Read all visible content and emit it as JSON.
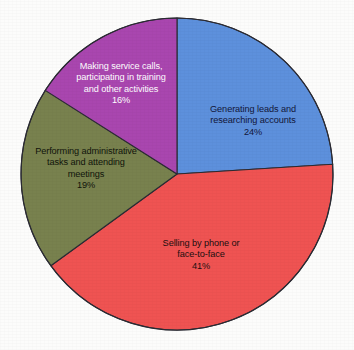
{
  "chart_data": {
    "type": "pie",
    "title": "",
    "subtitle": "",
    "xlabel": "",
    "ylabel": "",
    "legend_position": "none",
    "grid": false,
    "units": "percent",
    "total": 100,
    "start_angle_deg": 0,
    "direction": "clockwise",
    "categories": [
      "Generating leads and researching accounts",
      "Selling by phone or face-to-face",
      "Performing administrative tasks and attending meetings",
      "Making service calls, participating in training and other activities"
    ],
    "values": [
      24,
      41,
      19,
      16
    ],
    "slices": [
      {
        "label": "Generating leads and\nresearching accounts",
        "value": 24,
        "value_text": "24%",
        "color": "#5d90dc",
        "text_color": "#12163a",
        "start_deg": 0,
        "end_deg": 86.4
      },
      {
        "label": "Selling by phone or\nface-to-face",
        "value": 41,
        "value_text": "41%",
        "color": "#ef5352",
        "text_color": "#1b0f0f",
        "start_deg": 86.4,
        "end_deg": 234.0
      },
      {
        "label": "Performing administrative\ntasks and attending\nmeetings",
        "value": 19,
        "value_text": "19%",
        "color": "#78814e",
        "text_color": "#11140b",
        "start_deg": 234.0,
        "end_deg": 302.4
      },
      {
        "label": "Making service calls,\nparticipating in training\nand other activities",
        "value": 16,
        "value_text": "16%",
        "color": "#a946af",
        "text_color": "#ffffff",
        "start_deg": 302.4,
        "end_deg": 360.0
      }
    ],
    "colors": {
      "background": "#fcfcfb",
      "outline": "#2b2b33",
      "slice_1": "#5d90dc",
      "slice_2": "#ef5352",
      "slice_3": "#78814e",
      "slice_4": "#a946af"
    },
    "geometry": {
      "center_x": 177,
      "center_y": 174,
      "radius": 156
    }
  }
}
